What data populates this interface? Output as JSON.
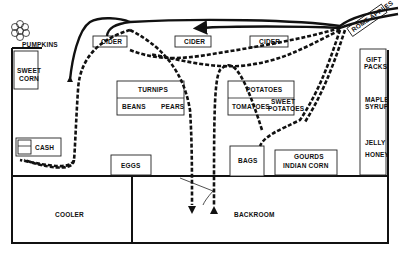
{
  "diagram": {
    "type": "store-floor-plan",
    "labels": {
      "pumpkins": "PUMPKINS",
      "sweet_corn_1": "SWEET",
      "sweet_corn_2": "CORN",
      "cash": "CASH",
      "cider_1": "CIDER",
      "cider_2": "CIDER",
      "cider_3": "CIDER",
      "rome_apples": "ROME APPLES",
      "turnips": "TURNIPS",
      "beans": "BEANS",
      "pears": "PEARS",
      "potatoes": "POTATOES",
      "tomatoes": "TOMATOES",
      "sweet_potatoes_1": "SWEET",
      "sweet_potatoes_2": "POTATOES",
      "eggs": "EGGS",
      "bags": "BAGS",
      "gourds": "GOURDS",
      "indian_corn": "INDIAN CORN",
      "gift_packs_1": "GIFT",
      "gift_packs_2": "PACKS",
      "maple_syrup_1": "MAPLE",
      "maple_syrup_2": "SYRUP",
      "jelly": "JELLY",
      "honey": "HONEY",
      "cooler": "COOLER",
      "backroom": "BACKROOM"
    },
    "colors": {
      "ink": "#111111",
      "background": "#ffffff"
    }
  }
}
